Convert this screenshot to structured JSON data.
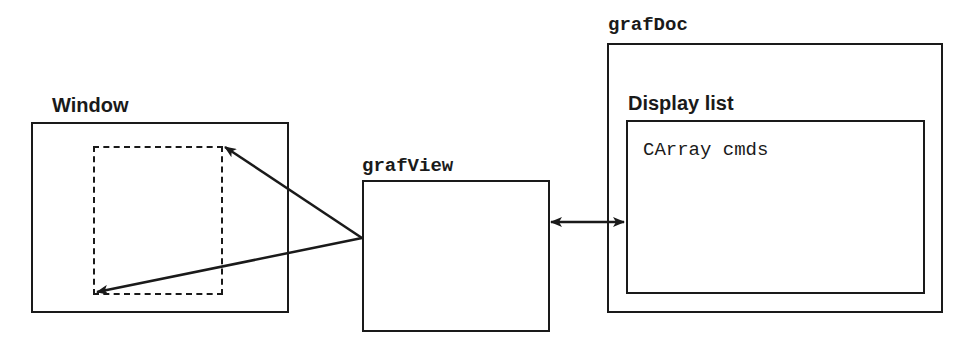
{
  "diagram": {
    "window": {
      "label": "Window"
    },
    "view": {
      "label": "grafView"
    },
    "doc": {
      "label": "grafDoc",
      "display_list": {
        "label": "Display list",
        "content": "CArray cmds"
      }
    },
    "edges": [
      {
        "from": "grafView",
        "to": "window-viewport-top-right",
        "type": "arrow"
      },
      {
        "from": "grafView",
        "to": "window-viewport-bottom-left",
        "type": "arrow"
      },
      {
        "from": "grafView",
        "to": "display-list",
        "type": "bidirectional-arrow"
      }
    ],
    "colors": {
      "stroke": "#1a1a1a",
      "background": "#ffffff"
    }
  }
}
